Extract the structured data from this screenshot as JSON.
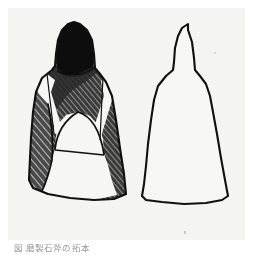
{
  "plate": {
    "background_color": "#f4f4f2",
    "page_color": "#ffffff",
    "ink_color": "#111111",
    "shade_fill_color": "#3d3d3d",
    "highlight_color": "#f6f6f4",
    "solid_black_color": "#0d0d0d"
  },
  "figures": [
    {
      "id": "left",
      "label": "shaded-view",
      "description": "Bell-shaped artifact rendered with dense diagonal hatching and solid black upper body, two pale V-shaped bands and a pale dome at mid-height",
      "outline_points": "60,16 54,22 50,32 48,46 47,58 44,62 34,70 28,84 25,104 23,130 22,150 21,172 25,180 40,186 62,190 86,192 106,191 118,186 116,166 112,140 108,112 104,88 98,74 92,66 87,60 86,46 84,32 79,22 72,16 66,14",
      "solid_cap_points": "60,16 54,22 50,32 48,48 49,62 58,68 72,68 85,62 86,46 84,32 79,22 72,16 66,14",
      "band_left_points": "39,66 33,72 30,80 46,124 54,124 44,82 46,72",
      "band_right_points": "96,70 102,78 104,88 92,130 84,128 96,86 94,74",
      "dome_points": "48,126 52,114 60,107 72,105 84,109 92,119 95,132 96,144 58,146 48,140",
      "lower_pale_points": "48,140 96,144 100,156 104,172 108,186 86,192 62,190 40,186 30,181 38,166 44,150"
    },
    {
      "id": "right",
      "label": "outline-view",
      "description": "Plain contour drawing of the same bell-shaped artifact, unshaded",
      "outline_points": "180,16 174,20 170,28 167,40 166,54 165,62 158,68 150,78 146,92 143,112 140,136 138,158 136,176 134,188 138,192 154,194 176,196 198,195 214,192 220,188 217,172 213,150 209,126 205,104 202,88 198,76 192,68 187,62 186,50 184,34 180,22"
    }
  ],
  "caption": {
    "text": "図 磨製石斧の拓本",
    "visible_note": "partially cropped faint caption at lower edge"
  },
  "marks": {
    "speck_label": "paper-speck"
  }
}
